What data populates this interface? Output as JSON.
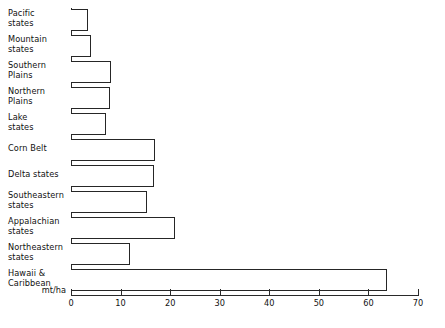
{
  "chart_data": {
    "type": "bar",
    "orientation": "horizontal",
    "title": "",
    "xlabel": "mt/ha",
    "ylabel": "",
    "xlim": [
      0,
      70
    ],
    "xticks": [
      0,
      10,
      20,
      30,
      40,
      50,
      60,
      70
    ],
    "grid": false,
    "legend": null,
    "bar_style": {
      "fill": "#ffffff",
      "edge": "#262626"
    },
    "categories": [
      "Pacific\nstates",
      "Mountain\nstates",
      "Southern\nPlains",
      "Northern\nPlains",
      "Lake\nstates",
      "Corn Belt",
      "Delta states",
      "Southeastern\nstates",
      "Appalachian\nstates",
      "Northeastern\nstates",
      "Hawaii &\nCaribbean"
    ],
    "values": [
      3.4,
      4.0,
      8.1,
      7.9,
      7.1,
      16.9,
      16.7,
      15.3,
      20.9,
      11.9,
      63.8
    ]
  }
}
